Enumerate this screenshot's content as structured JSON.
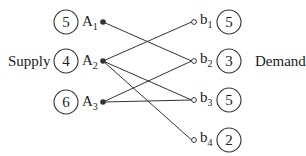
{
  "diagram": {
    "type": "bipartite-transportation-network",
    "supply_label": "Supply",
    "demand_label": "Demand",
    "sources": [
      {
        "id": "A1",
        "letter": "A",
        "sub": "1",
        "value": "5",
        "y": 22
      },
      {
        "id": "A2",
        "letter": "A",
        "sub": "2",
        "value": "4",
        "y": 61
      },
      {
        "id": "A3",
        "letter": "A",
        "sub": "3",
        "value": "6",
        "y": 102
      }
    ],
    "sinks": [
      {
        "id": "b1",
        "letter": "b",
        "sub": "1",
        "value": "5",
        "y": 22
      },
      {
        "id": "b2",
        "letter": "b",
        "sub": "2",
        "value": "3",
        "y": 61
      },
      {
        "id": "b3",
        "letter": "b",
        "sub": "3",
        "value": "5",
        "y": 100
      },
      {
        "id": "b4",
        "letter": "b",
        "sub": "4",
        "value": "2",
        "y": 140
      }
    ],
    "edges": [
      {
        "from": "A1",
        "to": "b2"
      },
      {
        "from": "A2",
        "to": "b1"
      },
      {
        "from": "A2",
        "to": "b3"
      },
      {
        "from": "A2",
        "to": "b4"
      },
      {
        "from": "A3",
        "to": "b2"
      },
      {
        "from": "A3",
        "to": "b3"
      }
    ],
    "colors": {
      "stroke": "#333333",
      "text": "#222222",
      "background": "#ffffff"
    }
  }
}
